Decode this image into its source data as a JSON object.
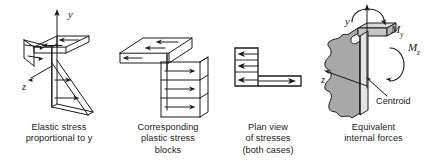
{
  "figure": {
    "background_color": "#ffffff",
    "line_color": "#1a1a1a",
    "shade_color": "#a8a8a8"
  },
  "panels": [
    {
      "id": "elastic-stress",
      "caption_lines": [
        "Elastic stress",
        "proportional to y"
      ],
      "axis_labels": [
        "y",
        "z"
      ],
      "arrow_count": 6,
      "description": "angle section with triangular elastic stress wedge"
    },
    {
      "id": "plastic-stress-blocks",
      "caption_lines": [
        "Corresponding",
        "plastic stress",
        "blocks"
      ],
      "axis_labels": [],
      "arrow_count": 6,
      "description": "angle section with rectangular plastic stress blocks"
    },
    {
      "id": "plan-view-stresses",
      "caption_lines": [
        "Plan view",
        "of stresses",
        "(both cases)"
      ],
      "axis_labels": [],
      "arrow_count": 4,
      "description": "L shaped plan view with stress arrows"
    },
    {
      "id": "equivalent-internal-forces",
      "caption_lines": [
        "Equivalent",
        "internal forces"
      ],
      "axis_labels": [
        "y",
        "z"
      ],
      "moment_labels": [
        "M",
        "y",
        "M",
        "z"
      ],
      "annotation": "Centroid",
      "description": "shaded angle section with moment vectors My and Mz about centroid"
    }
  ]
}
